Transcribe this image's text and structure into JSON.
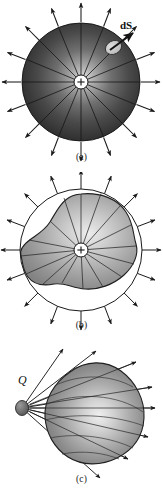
{
  "figure": {
    "background_color": "#ffffff",
    "ink_color": "#1a1a1a"
  },
  "panels": [
    {
      "id": "a",
      "caption": "(a)",
      "description": "Uniformly charged sphere with radial field lines and a surface element",
      "labels": {
        "surface_element": "dS",
        "center_charge_sign": "+"
      },
      "colors": {
        "sphere_dark": "#2b2b2b",
        "sphere_mid": "#6e6e6e",
        "sphere_light": "#d8d8d8",
        "patch_fill": "#c9c9c9",
        "outline": "#1a1a1a"
      },
      "geometry": {
        "center_x": 81,
        "center_y": 82,
        "radius": 59,
        "arrow_count": 16,
        "core_radius": 7
      }
    },
    {
      "id": "b",
      "caption": "(b)",
      "description": "Irregular closed surface inside a sphere, same total flux, radial arrows",
      "labels": {
        "center_charge_sign": "+"
      },
      "colors": {
        "blob_dark": "#8d8d8d",
        "blob_mid": "#b4b4b4",
        "blob_light": "#e2e2e2",
        "circle_stroke": "#1a1a1a",
        "outline": "#1a1a1a"
      },
      "geometry": {
        "center_x": 81,
        "center_y": 250,
        "circle_radius": 61,
        "arrow_count": 16,
        "core_radius": 7
      }
    },
    {
      "id": "c",
      "caption": "(c)",
      "description": "Point charge Q outside an egg-shaped surface with rays passing through",
      "labels": {
        "charge": "Q"
      },
      "colors": {
        "egg_dark": "#7a7a7a",
        "egg_mid": "#a8a8a8",
        "egg_light": "#e6e6e6",
        "charge_fill": "#6a6a6a",
        "outline": "#1a1a1a"
      },
      "geometry": {
        "charge_x": 22,
        "charge_y": 408,
        "ray_count": 9
      }
    }
  ]
}
